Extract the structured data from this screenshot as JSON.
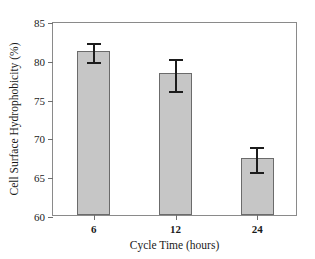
{
  "chart_data": {
    "type": "bar",
    "title": "",
    "xlabel": "Cycle Time (hours)",
    "ylabel": "Cell Surface Hydrophobicity (%)",
    "categories": [
      "6",
      "12",
      "24"
    ],
    "values": [
      81.2,
      78.3,
      67.4
    ],
    "errors": [
      1.2,
      2.1,
      1.6
    ],
    "ylim": [
      60,
      85
    ],
    "yticks": [
      60,
      65,
      70,
      75,
      80,
      85
    ],
    "ytick_labels": [
      "60",
      "65",
      "70",
      "75",
      "80",
      "85"
    ],
    "grid": false,
    "legend": "none",
    "bar_color": "#c6c6c6",
    "bar_edge_color": "#6b6b6b",
    "error_color": "#1c1c1c",
    "axis_color": "#8a8a8a"
  }
}
